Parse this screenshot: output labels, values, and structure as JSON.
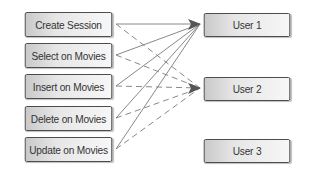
{
  "diagram": {
    "actions": [
      {
        "label": "Create Session",
        "top": 12
      },
      {
        "label": "Select on Movies",
        "top": 43
      },
      {
        "label": "Insert on Movies",
        "top": 74
      },
      {
        "label": "Delete on Movies",
        "top": 106
      },
      {
        "label": "Update on Movies",
        "top": 137
      }
    ],
    "users": [
      {
        "label": "User 1",
        "top": 13
      },
      {
        "label": "User 2",
        "top": 77
      },
      {
        "label": "User 3",
        "top": 139
      }
    ],
    "edges": [
      {
        "from": "Create Session",
        "to": "User 1",
        "style": "solid"
      },
      {
        "from": "Select on Movies",
        "to": "User 1",
        "style": "solid"
      },
      {
        "from": "Insert on Movies",
        "to": "User 1",
        "style": "solid"
      },
      {
        "from": "Delete on Movies",
        "to": "User 1",
        "style": "solid"
      },
      {
        "from": "Update on Movies",
        "to": "User 1",
        "style": "solid"
      },
      {
        "from": "Create Session",
        "to": "User 2",
        "style": "dashed"
      },
      {
        "from": "Select on Movies",
        "to": "User 2",
        "style": "dashed"
      },
      {
        "from": "Insert on Movies",
        "to": "User 2",
        "style": "dashed"
      },
      {
        "from": "Delete on Movies",
        "to": "User 2",
        "style": "dashed"
      },
      {
        "from": "Update on Movies",
        "to": "User 2",
        "style": "dashed"
      }
    ],
    "colors": {
      "line": "#7a7a7a",
      "arrow": "#555555",
      "border": "#444444"
    }
  }
}
